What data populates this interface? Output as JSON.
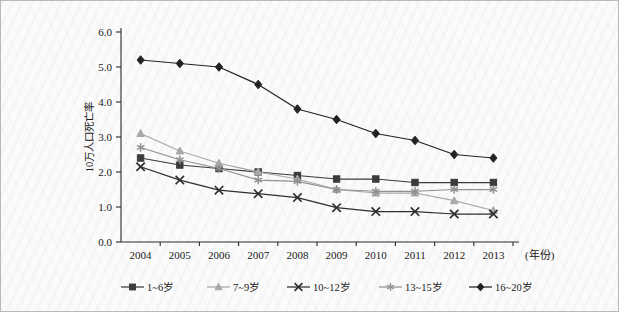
{
  "chart_data": {
    "type": "line",
    "title": "",
    "xlabel": "(年份)",
    "ylabel": "10万人口死亡率",
    "categories": [
      "2004",
      "2005",
      "2006",
      "2007",
      "2008",
      "2009",
      "2010",
      "2011",
      "2012",
      "2013"
    ],
    "x": [
      2004,
      2005,
      2006,
      2007,
      2008,
      2009,
      2010,
      2011,
      2012,
      2013
    ],
    "ylim": [
      0.0,
      6.0
    ],
    "ytick_labels": [
      "0.0",
      "1.0",
      "2.0",
      "3.0",
      "4.0",
      "5.0",
      "6.0"
    ],
    "ytick_values": [
      0.0,
      1.0,
      2.0,
      3.0,
      4.0,
      5.0,
      6.0
    ],
    "grid": false,
    "legend_position": "bottom",
    "series": [
      {
        "name": "1~6岁",
        "marker": "square",
        "color": "#3b3b3b",
        "values": [
          2.4,
          2.2,
          2.1,
          2.0,
          1.9,
          1.8,
          1.8,
          1.7,
          1.7,
          1.7
        ]
      },
      {
        "name": "7~9岁",
        "marker": "triangle",
        "color": "#a8a8a8",
        "values": [
          3.1,
          2.6,
          2.25,
          2.0,
          1.8,
          1.5,
          1.4,
          1.4,
          1.18,
          0.9
        ]
      },
      {
        "name": "10~12岁",
        "marker": "x",
        "color": "#2e2e2e",
        "values": [
          2.15,
          1.77,
          1.48,
          1.38,
          1.27,
          0.98,
          0.87,
          0.87,
          0.8,
          0.8
        ]
      },
      {
        "name": "13~15岁",
        "marker": "asterisk",
        "color": "#909090",
        "values": [
          2.7,
          2.35,
          2.1,
          1.77,
          1.73,
          1.5,
          1.45,
          1.45,
          1.5,
          1.5
        ]
      },
      {
        "name": "16~20岁",
        "marker": "diamond",
        "color": "#222222",
        "values": [
          5.2,
          5.1,
          5.0,
          4.5,
          3.8,
          3.5,
          3.1,
          2.9,
          2.5,
          2.4
        ]
      }
    ]
  }
}
